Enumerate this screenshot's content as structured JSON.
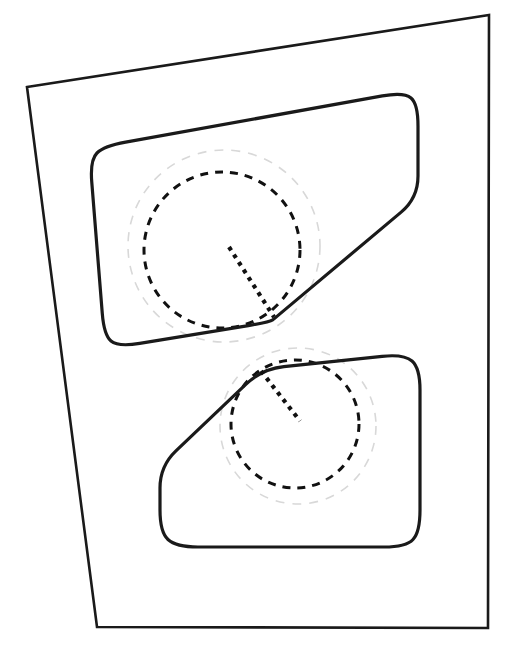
{
  "document": {
    "title": "Technical drawing - 2D machining pocket profile",
    "background_color": "#ffffff",
    "width": 514,
    "height": 651
  },
  "style": {
    "outline_color": "#1a1a1a",
    "outline_width": 2.6,
    "pocket_color": "#1a1a1a",
    "pocket_width": 3.2,
    "tool_path_color": "#111111",
    "tool_path_width": 3.0,
    "offset_guide_color": "#d8d8d8",
    "offset_guide_width": 1.6,
    "lead_in_color": "#111111",
    "lead_in_width": 4.2,
    "dash_pattern_inner": "8 7",
    "dash_pattern_outer": "9 8",
    "dash_pattern_lead": "4 5"
  },
  "geometry": {
    "stock_outline": {
      "name": "stock-boundary",
      "shape": "quadrilateral",
      "points": [
        [
          27,
          87
        ],
        [
          489,
          15
        ],
        [
          488,
          628
        ],
        [
          97,
          627
        ]
      ]
    },
    "upper_pocket": {
      "name": "upper-pocket-boundary",
      "corner_radius": 22,
      "points": [
        [
          104,
          146
        ],
        [
          404,
          92
        ],
        [
          418,
          104
        ],
        [
          418,
          198
        ],
        [
          275,
          318
        ],
        [
          270,
          322
        ],
        [
          118,
          347
        ],
        [
          104,
          335
        ],
        [
          90,
          160
        ]
      ]
    },
    "lower_pocket": {
      "name": "lower-pocket-boundary",
      "corner_radius": 22,
      "points": [
        [
          262,
          369
        ],
        [
          404,
          354
        ],
        [
          420,
          368
        ],
        [
          420,
          532
        ],
        [
          406,
          547
        ],
        [
          176,
          547
        ],
        [
          160,
          532
        ],
        [
          160,
          466
        ]
      ]
    },
    "upper_tool_circle": {
      "name": "upper-tool-path-circle",
      "cx": 222,
      "cy": 250,
      "r": 78,
      "stroke": "#111111",
      "dasharray": "8 7"
    },
    "upper_offset_circle": {
      "name": "upper-offset-guide-circle",
      "cx": 224,
      "cy": 246,
      "r": 96,
      "stroke": "#d8d8d8",
      "dasharray": "9 8"
    },
    "lower_tool_circle": {
      "name": "lower-tool-path-circle",
      "cx": 295,
      "cy": 424,
      "r": 64,
      "stroke": "#111111",
      "dasharray": "8 7"
    },
    "lower_offset_circle": {
      "name": "lower-offset-guide-circle",
      "cx": 298,
      "cy": 426,
      "r": 78,
      "stroke": "#d8d8d8",
      "dasharray": "9 8"
    },
    "upper_lead_in": {
      "name": "upper-lead-in-line",
      "x1": 229,
      "y1": 247,
      "x2": 274,
      "y2": 317
    },
    "lower_lead_in": {
      "name": "lower-lead-in-line",
      "x1": 261,
      "y1": 371,
      "x2": 300,
      "y2": 421
    }
  },
  "labels": {
    "caption": "",
    "annotations": []
  }
}
